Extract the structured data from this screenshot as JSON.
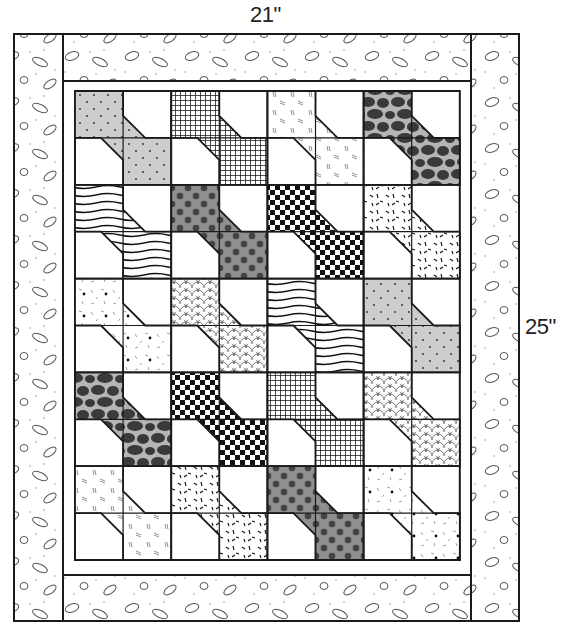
{
  "diagram": {
    "dimensions": {
      "width_label": "21\"",
      "height_label": "25\""
    },
    "layout": {
      "block_columns": 4,
      "block_rows": 5,
      "block_style": "bow-tie",
      "inner_border": "white sashing strip",
      "outer_border": "pebble/dot print"
    },
    "colors": {
      "line": "#1a1a1a",
      "light_gray": "#cfcfcf",
      "mid_gray": "#8f8f8f",
      "dark": "#3a3a3a",
      "background": "#ffffff"
    },
    "blocks": [
      [
        "gray-dots",
        "grid",
        "dashes",
        "giraffe"
      ],
      [
        "wavy",
        "polka",
        "checker",
        "confetti"
      ],
      [
        "sparse-dots",
        "scales",
        "wavy",
        "gray-dots"
      ],
      [
        "giraffe",
        "checker",
        "grid",
        "scales"
      ],
      [
        "dashes",
        "confetti",
        "polka",
        "sparse-dots"
      ]
    ]
  }
}
